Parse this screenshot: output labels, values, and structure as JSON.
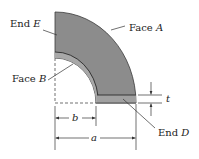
{
  "diagram": {
    "type": "quarter-annulus part with dimensions",
    "labels": {
      "end_e": {
        "text": "End ",
        "var": "E"
      },
      "face_a": {
        "text": "Face ",
        "var": "A"
      },
      "face_b": {
        "text": "Face ",
        "var": "B"
      },
      "end_d": {
        "text": "End ",
        "var": "D"
      },
      "dim_t": "t",
      "dim_b": "b",
      "dim_a": "a"
    },
    "colors": {
      "body_fill": "#8c8c8c",
      "face_b_fill": "#a8a8a8",
      "edge": "#3a3a3a",
      "dimension_line": "#333333",
      "background": "#ffffff"
    }
  }
}
